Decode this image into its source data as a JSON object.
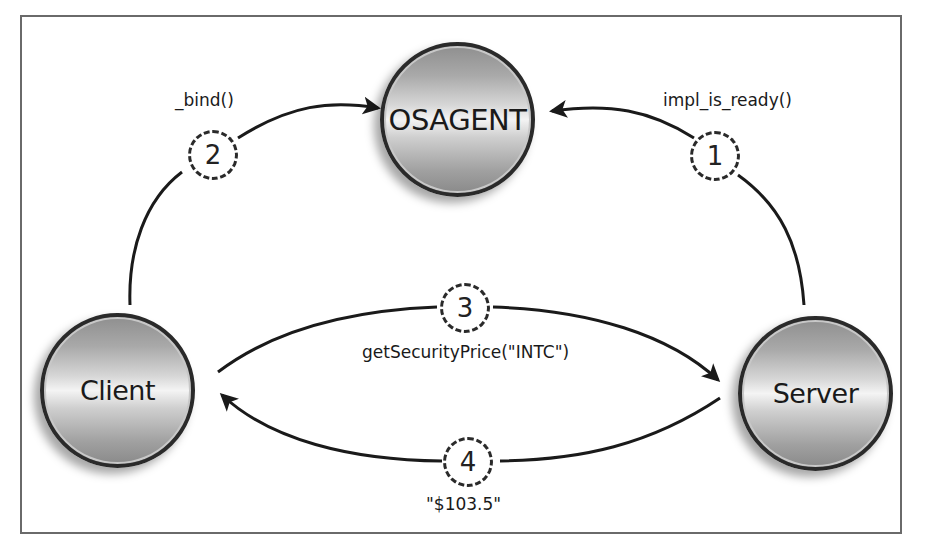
{
  "nodes": {
    "osagent": "OSAGENT",
    "client": "Client",
    "server": "Server"
  },
  "steps": [
    {
      "number": "1",
      "label": "impl_is_ready()",
      "from": "Server",
      "to": "OSAGENT"
    },
    {
      "number": "2",
      "label": "_bind()",
      "from": "Client",
      "to": "OSAGENT"
    },
    {
      "number": "3",
      "label": "getSecurityPrice(\"INTC\")",
      "from": "Client",
      "to": "Server"
    },
    {
      "number": "4",
      "label": "\"$103.5\"",
      "from": "Server",
      "to": "Client"
    }
  ],
  "colors": {
    "line": "#1a1a1a",
    "frame": "#6a6a6a",
    "node_border": "#2a2a2a"
  }
}
